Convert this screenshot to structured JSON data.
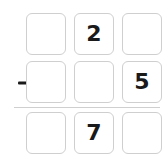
{
  "worksheet": {
    "type": "vertical-subtraction-problem",
    "operator_symbol": "−",
    "operator_name": "minus-sign",
    "colors": {
      "background": "#ffffff",
      "box_border": "#cfcfcf",
      "digit": "#1a1a1a",
      "rule": "#cfcfcf"
    },
    "rows": [
      {
        "name": "minuend-row",
        "operator": "",
        "cells": [
          {
            "name": "minuend-hundreds",
            "value": "",
            "filled": false
          },
          {
            "name": "minuend-tens",
            "value": "2",
            "filled": true
          },
          {
            "name": "minuend-ones",
            "value": "",
            "filled": false
          }
        ]
      },
      {
        "name": "subtrahend-row",
        "operator": "−",
        "cells": [
          {
            "name": "subtrahend-hundreds",
            "value": "",
            "filled": false
          },
          {
            "name": "subtrahend-tens",
            "value": "",
            "filled": false
          },
          {
            "name": "subtrahend-ones",
            "value": "5",
            "filled": true
          }
        ]
      },
      {
        "name": "difference-row",
        "operator": "",
        "cells": [
          {
            "name": "difference-hundreds",
            "value": "",
            "filled": false
          },
          {
            "name": "difference-tens",
            "value": "7",
            "filled": true
          },
          {
            "name": "difference-ones",
            "value": "",
            "filled": false
          }
        ]
      }
    ]
  }
}
